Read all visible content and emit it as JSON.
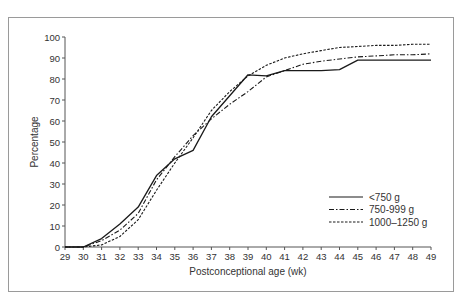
{
  "chart_data": {
    "type": "line",
    "title": "",
    "xlabel": "Postconceptional age (wk)",
    "ylabel": "Percentage",
    "xlim": [
      29,
      49
    ],
    "ylim": [
      0,
      100
    ],
    "x_ticks": [
      29,
      30,
      31,
      32,
      33,
      34,
      35,
      36,
      37,
      38,
      39,
      40,
      41,
      42,
      43,
      44,
      45,
      46,
      47,
      48,
      49
    ],
    "y_ticks": [
      0,
      10,
      20,
      30,
      40,
      50,
      60,
      70,
      80,
      90,
      100
    ],
    "grid": false,
    "legend_position": "lower right",
    "x": [
      29,
      30,
      31,
      32,
      33,
      34,
      35,
      36,
      37,
      38,
      39,
      40,
      41,
      42,
      43,
      44,
      45,
      46,
      47,
      48,
      49
    ],
    "series": [
      {
        "name": "<750 g",
        "style": "solid",
        "values": [
          0,
          0,
          4,
          11,
          19,
          34,
          42,
          46,
          62,
          72,
          82,
          81.5,
          84,
          84,
          84,
          84.5,
          89,
          89,
          89,
          89,
          89
        ]
      },
      {
        "name": "750-999 g",
        "style": "dash-dot",
        "values": [
          0,
          0,
          3,
          8,
          16,
          32,
          43,
          53,
          61,
          68,
          74,
          81,
          84,
          87,
          88.5,
          89.5,
          90.5,
          91,
          91.5,
          91.5,
          92
        ]
      },
      {
        "name": "1000–1250 g",
        "style": "dashed",
        "values": [
          0,
          0,
          1,
          5,
          13,
          27,
          40,
          52,
          65,
          74,
          81.5,
          86.5,
          90,
          92,
          93.5,
          95,
          95.5,
          96,
          96,
          96.5,
          96.5
        ]
      }
    ]
  }
}
